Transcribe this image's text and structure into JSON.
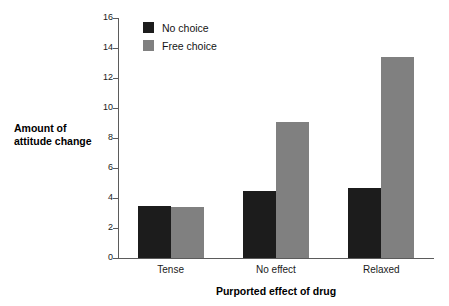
{
  "chart_data": {
    "type": "bar",
    "title": "",
    "xlabel": "Purported effect of drug",
    "ylabel_lines": [
      "Amount of",
      "attitude change"
    ],
    "ylabel": "Amount of attitude change",
    "categories": [
      "Tense",
      "No effect",
      "Relaxed"
    ],
    "series": [
      {
        "name": "No choice",
        "color": "#1c1c1c",
        "values": [
          3.5,
          4.5,
          4.65
        ]
      },
      {
        "name": "Free choice",
        "color": "#808080",
        "values": [
          3.4,
          9.05,
          13.4
        ]
      }
    ],
    "ylim": [
      0,
      16
    ],
    "ytick_step": 2,
    "yticks": [
      0,
      2,
      4,
      6,
      8,
      10,
      12,
      14,
      16
    ],
    "ytick_labels": [
      "0",
      "2",
      "4",
      "6",
      "8",
      "10",
      "12",
      "14",
      "16"
    ],
    "grid": false,
    "legend_position": "top-left-inside",
    "axis_color": "#5b5b5b",
    "background": "#ffffff"
  }
}
